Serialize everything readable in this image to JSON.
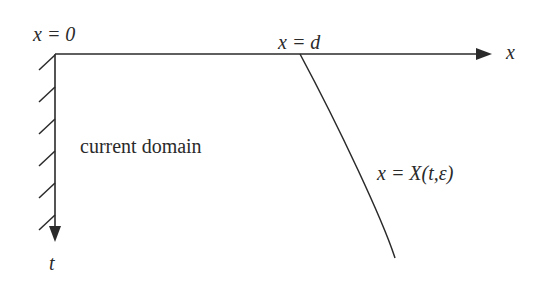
{
  "diagram": {
    "labels": {
      "origin": "x = 0",
      "d_point": "x = d",
      "x_axis": "x",
      "t_axis": "t",
      "region": "current  domain",
      "curve": "x = X(t,ε)"
    },
    "colors": {
      "line": "#2a2a2a",
      "background": "#ffffff"
    },
    "axes": {
      "origin_px": [
        55,
        54
      ],
      "x_axis_end_px": [
        492,
        54
      ],
      "t_axis_end_px": [
        55,
        242
      ]
    },
    "hatch_count": 6,
    "curve_start_px": [
      300,
      54
    ],
    "curve_end_px": [
      395,
      258
    ]
  }
}
